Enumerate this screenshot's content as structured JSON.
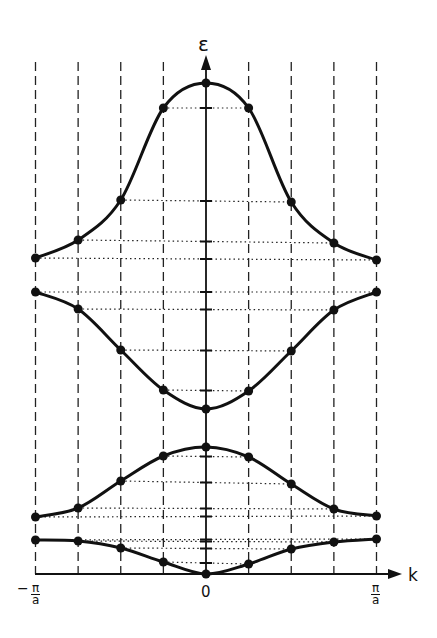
{
  "figure": {
    "y_axis_label": "ε",
    "x_axis_label": "k",
    "x_ticks": {
      "left": {
        "sign": "−",
        "num": "π",
        "den": "a"
      },
      "center": "0",
      "right": {
        "num": "π",
        "den": "a"
      }
    }
  },
  "chart_data": {
    "type": "line",
    "title": "",
    "xlabel": "k",
    "ylabel": "ε",
    "x_range": [
      "-π/a",
      "π/a"
    ],
    "x": [
      -1,
      -0.75,
      -0.5,
      -0.25,
      0,
      0.25,
      0.5,
      0.75,
      1
    ],
    "x_units": "π/a",
    "grid": "vertical dashed lines at each sampled k; dotted horizontal lines linking symmetric points to ε-axis ticks",
    "series": [
      {
        "name": "band 1",
        "values": [
          0.34,
          0.33,
          0.26,
          0.12,
          0.0,
          0.1,
          0.25,
          0.32,
          0.35
        ]
      },
      {
        "name": "band 2",
        "values": [
          0.57,
          0.66,
          0.93,
          1.18,
          1.27,
          1.17,
          0.9,
          0.65,
          0.58
        ]
      },
      {
        "name": "band 3",
        "values": [
          2.82,
          2.65,
          2.24,
          1.84,
          1.65,
          1.83,
          2.23,
          2.64,
          2.82
        ]
      },
      {
        "name": "band 4",
        "values": [
          3.16,
          3.34,
          3.74,
          4.66,
          4.91,
          4.66,
          3.72,
          3.31,
          3.14
        ]
      }
    ],
    "ylim": [
      0,
      5.2
    ]
  }
}
